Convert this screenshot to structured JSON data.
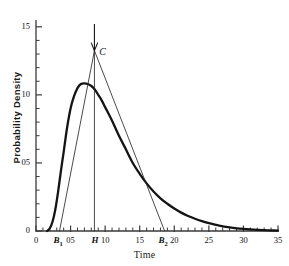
{
  "chart_data": {
    "type": "line",
    "title": "",
    "xlabel": "Time",
    "ylabel": "Probability Density",
    "xlim": [
      0,
      35
    ],
    "ylim": [
      0,
      0.155
    ],
    "grid": false,
    "legend": "none",
    "x_major_ticks": [
      0,
      5,
      10,
      15,
      20,
      25,
      30,
      35
    ],
    "x_major_tick_labels": [
      "0",
      "05",
      "10",
      "15",
      "20",
      "25",
      "30",
      "35"
    ],
    "x_minor_tick_step": 1,
    "y_major_ticks": [
      0,
      0.05,
      0.1,
      0.15
    ],
    "y_major_tick_labels": [
      "0",
      "05",
      "10",
      "15"
    ],
    "y_minor_tick_step": 0.01,
    "series": [
      {
        "name": "probability density curve",
        "style": "thick-solid",
        "x": [
          1.6,
          2.0,
          2.4,
          2.8,
          3.2,
          3.6,
          4.0,
          4.5,
          5.0,
          5.5,
          6.0,
          6.5,
          7.0,
          7.5,
          8.0,
          8.5,
          9.0,
          9.5,
          10.0,
          11.0,
          12.0,
          13.0,
          14.0,
          15.0,
          16.0,
          17.0,
          18.0,
          19.0,
          20.0,
          21.0,
          22.0,
          23.0,
          24.0,
          25.0,
          26.5,
          28.0,
          30.0,
          32.0,
          35.0
        ],
        "y": [
          0.0,
          0.002,
          0.007,
          0.016,
          0.029,
          0.044,
          0.058,
          0.076,
          0.09,
          0.099,
          0.105,
          0.108,
          0.1085,
          0.108,
          0.1065,
          0.104,
          0.1,
          0.096,
          0.091,
          0.081,
          0.07,
          0.06,
          0.05,
          0.042,
          0.035,
          0.029,
          0.024,
          0.02,
          0.0165,
          0.0135,
          0.011,
          0.009,
          0.0072,
          0.0058,
          0.004,
          0.0027,
          0.0015,
          0.0008,
          0.0003
        ]
      },
      {
        "name": "triangular approximation",
        "style": "thin-solid",
        "x": [
          3.4,
          8.45,
          18.6
        ],
        "y": [
          0.0,
          0.1325,
          0.0
        ]
      },
      {
        "name": "mode vertical line at H",
        "style": "thin-solid",
        "x": [
          8.45,
          8.45
        ],
        "y": [
          0.0,
          0.1345
        ]
      }
    ],
    "annotations": [
      {
        "name": "apex-arrow",
        "label": "",
        "x": 8.45,
        "y": 0.1325,
        "type": "down-arrow",
        "tail_y": 0.152
      },
      {
        "name": "apex-label",
        "label": "C",
        "x": 9.3,
        "y": 0.131
      },
      {
        "name": "left-base-label",
        "label": "B",
        "sub": "1",
        "x": 3.4,
        "y": 0
      },
      {
        "name": "mode-label",
        "label": "H",
        "x": 8.45,
        "y": 0
      },
      {
        "name": "right-base-label",
        "label": "B",
        "sub": "2",
        "x": 18.6,
        "y": 0
      }
    ],
    "colors": {
      "curve": "#141414",
      "triangle": "#2b2b2b",
      "axis": "#3a3a3a",
      "text": "#1a1a1a",
      "background": "#ffffff"
    }
  }
}
